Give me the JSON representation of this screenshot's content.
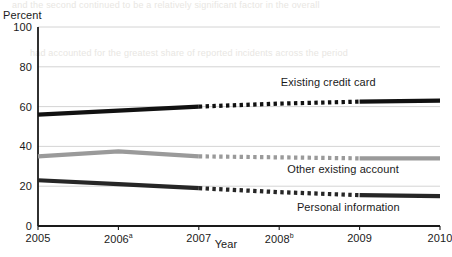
{
  "bleed_text": [
    "and the second continued to be a relatively significant factor in the overall",
    "had accounted for the greatest share of reported incidents across the period"
  ],
  "chart_data": {
    "type": "line",
    "title": "",
    "xlabel": "Year",
    "ylabel": "Percent",
    "ylabel_position": "top-left",
    "x": [
      "2005",
      "2006",
      "2007",
      "2008",
      "2009",
      "2010"
    ],
    "xtick_labels": [
      "2005",
      "2006a",
      "2007",
      "2008b",
      "2009",
      "2010"
    ],
    "xtick_footnotes": [
      "",
      "a",
      "",
      "b",
      "",
      ""
    ],
    "ylim": [
      0,
      100
    ],
    "yticks": [
      0,
      20,
      40,
      60,
      80,
      100
    ],
    "grid": "horizontal",
    "legend": "inline-labels",
    "series": [
      {
        "name": "Existing credit card",
        "values": [
          56,
          58,
          60,
          61.5,
          62.5,
          63
        ],
        "color": "#111111",
        "width": 4.2,
        "label_x": 2008.02,
        "label_y": 72,
        "dashed_range": [
          "2007",
          "2009"
        ]
      },
      {
        "name": "Other existing account",
        "values": [
          35,
          37.5,
          35,
          34.5,
          34,
          34
        ],
        "color": "#9a9a9a",
        "width": 4.2,
        "label_x": 2008.1,
        "label_y": 28,
        "dashed_range": [
          "2007",
          "2009"
        ]
      },
      {
        "name": "Personal information",
        "values": [
          23,
          21,
          19,
          17,
          15.5,
          15
        ],
        "color": "#262626",
        "width": 4.2,
        "label_x": 2008.22,
        "label_y": 9,
        "dashed_range": [
          "2007",
          "2009"
        ]
      }
    ]
  }
}
